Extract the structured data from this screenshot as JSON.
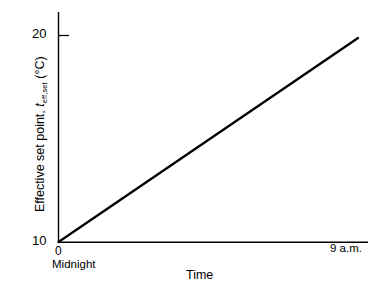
{
  "figure": {
    "background_color": "#ffffff",
    "line_color": "#000000"
  },
  "axes": {
    "y": {
      "title_prefix": "Effective set point, ",
      "title_symbol": "t",
      "title_subscript": "eff,set",
      "title_units": " (°C)",
      "title_full": "Effective set point, teff,set (°C)",
      "tick_top": "20",
      "tick_bottom": "10"
    },
    "x": {
      "title": "Time",
      "tick_origin": "0",
      "tick_origin_sub": "Midnight",
      "tick_end": "9 a.m."
    }
  },
  "chart_data": {
    "type": "line",
    "title": "",
    "xlabel": "Time",
    "ylabel": "Effective set point, teff,set (°C)",
    "xlim": [
      0,
      9
    ],
    "ylim": [
      10,
      20
    ],
    "xtick_labels": [
      "0",
      "9 a.m."
    ],
    "xtick_sublabels": [
      "Midnight",
      ""
    ],
    "ytick_labels": [
      "10",
      "20"
    ],
    "ytick_values": [
      10,
      20
    ],
    "grid": false,
    "legend": false,
    "series": [
      {
        "name": "Effective set point ramp",
        "x": [
          0,
          9
        ],
        "y": [
          10,
          20
        ]
      }
    ],
    "annotations": []
  }
}
